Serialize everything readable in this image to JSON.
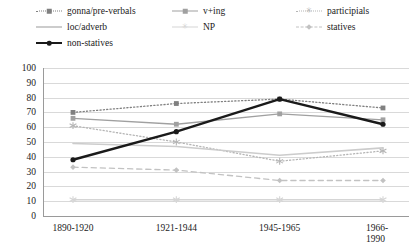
{
  "chart_data": {
    "type": "line",
    "title": "",
    "xlabel": "",
    "ylabel": "",
    "categories": [
      "1890-1920",
      "1921-1944",
      "1945-1965",
      "1966-1990"
    ],
    "ylim": [
      0,
      100
    ],
    "yticks": [
      0,
      10,
      20,
      30,
      40,
      50,
      60,
      70,
      80,
      90,
      100
    ],
    "grid": true,
    "legend_position": "top",
    "series": [
      {
        "name": "gonna/pre-verbals",
        "values": [
          70,
          76,
          79,
          73
        ],
        "color": "#808080",
        "style": "dotted",
        "marker": "square",
        "width": 1.3
      },
      {
        "name": "v+ing",
        "values": [
          66,
          62,
          69,
          65
        ],
        "color": "#a0a0a0",
        "style": "solid",
        "marker": "square",
        "width": 1.3
      },
      {
        "name": "participials",
        "values": [
          61,
          50,
          37,
          44
        ],
        "color": "#b5b5b5",
        "style": "dotted",
        "marker": "star",
        "width": 1.3
      },
      {
        "name": "loc/adverb",
        "values": [
          49,
          47,
          41,
          46
        ],
        "color": "#cccccc",
        "style": "solid",
        "marker": "none",
        "width": 1.6
      },
      {
        "name": "NP",
        "values": [
          11,
          11,
          11,
          11
        ],
        "color": "#d5d5d5",
        "style": "solid",
        "marker": "star",
        "width": 1.4
      },
      {
        "name": "statives",
        "values": [
          33,
          31,
          24,
          24
        ],
        "color": "#c2c2c2",
        "style": "dashed",
        "marker": "diamond",
        "width": 1.3
      },
      {
        "name": "non-statives",
        "values": [
          38,
          57,
          79,
          62
        ],
        "color": "#1a1a1a",
        "style": "solid",
        "marker": "dot",
        "width": 2.4
      }
    ]
  },
  "legend": {
    "items": [
      {
        "label": "gonna/pre-verbals",
        "series": 0,
        "col": 0,
        "row": 0
      },
      {
        "label": "v+ing",
        "series": 1,
        "col": 1,
        "row": 0
      },
      {
        "label": "participials",
        "series": 2,
        "col": 2,
        "row": 0
      },
      {
        "label": "loc/adverb",
        "series": 3,
        "col": 0,
        "row": 1
      },
      {
        "label": "NP",
        "series": 4,
        "col": 1,
        "row": 1
      },
      {
        "label": "statives",
        "series": 5,
        "col": 2,
        "row": 1
      },
      {
        "label": "non-statives",
        "series": 6,
        "col": 0,
        "row": 2
      }
    ]
  }
}
